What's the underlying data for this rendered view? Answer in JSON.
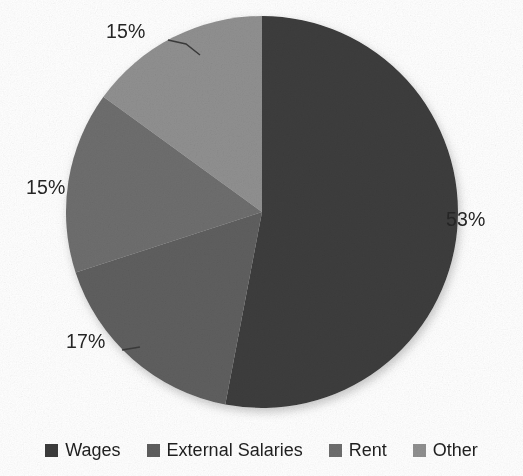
{
  "chart_data": {
    "type": "pie",
    "title": "",
    "subtitle": "",
    "xlabel": "",
    "ylabel": "",
    "legend_position": "bottom",
    "grid": false,
    "start_angle_deg": 0,
    "direction": "clockwise",
    "categories": [
      "Wages",
      "External Salaries",
      "Rent",
      "Other"
    ],
    "values": [
      53,
      17,
      15,
      15
    ],
    "value_unit": "%",
    "data_labels": [
      "53%",
      "17%",
      "15%",
      "15%"
    ],
    "colors": [
      "#3c3c3c",
      "#5e5e5e",
      "#6e6e6e",
      "#909090"
    ],
    "slices": [
      {
        "label": "Wages",
        "value": 53,
        "display": "53%",
        "color": "#3c3c3c",
        "start_deg": 0.0,
        "end_deg": 190.8
      },
      {
        "label": "External Salaries",
        "value": 17,
        "display": "17%",
        "color": "#5e5e5e",
        "start_deg": 190.8,
        "end_deg": 252.0
      },
      {
        "label": "Rent",
        "value": 15,
        "display": "15%",
        "color": "#6e6e6e",
        "start_deg": 252.0,
        "end_deg": 306.0
      },
      {
        "label": "Other",
        "value": 15,
        "display": "15%",
        "color": "#909090",
        "start_deg": 306.0,
        "end_deg": 360.0
      }
    ]
  },
  "labels": {
    "wages_pct": "53%",
    "external_salaries_pct": "17%",
    "rent_pct": "15%",
    "other_pct": "15%"
  },
  "legend": {
    "items": [
      {
        "label": "Wages",
        "color": "#3c3c3c"
      },
      {
        "label": "External Salaries",
        "color": "#5e5e5e"
      },
      {
        "label": "Rent",
        "color": "#6e6e6e"
      },
      {
        "label": "Other",
        "color": "#909090"
      }
    ]
  }
}
